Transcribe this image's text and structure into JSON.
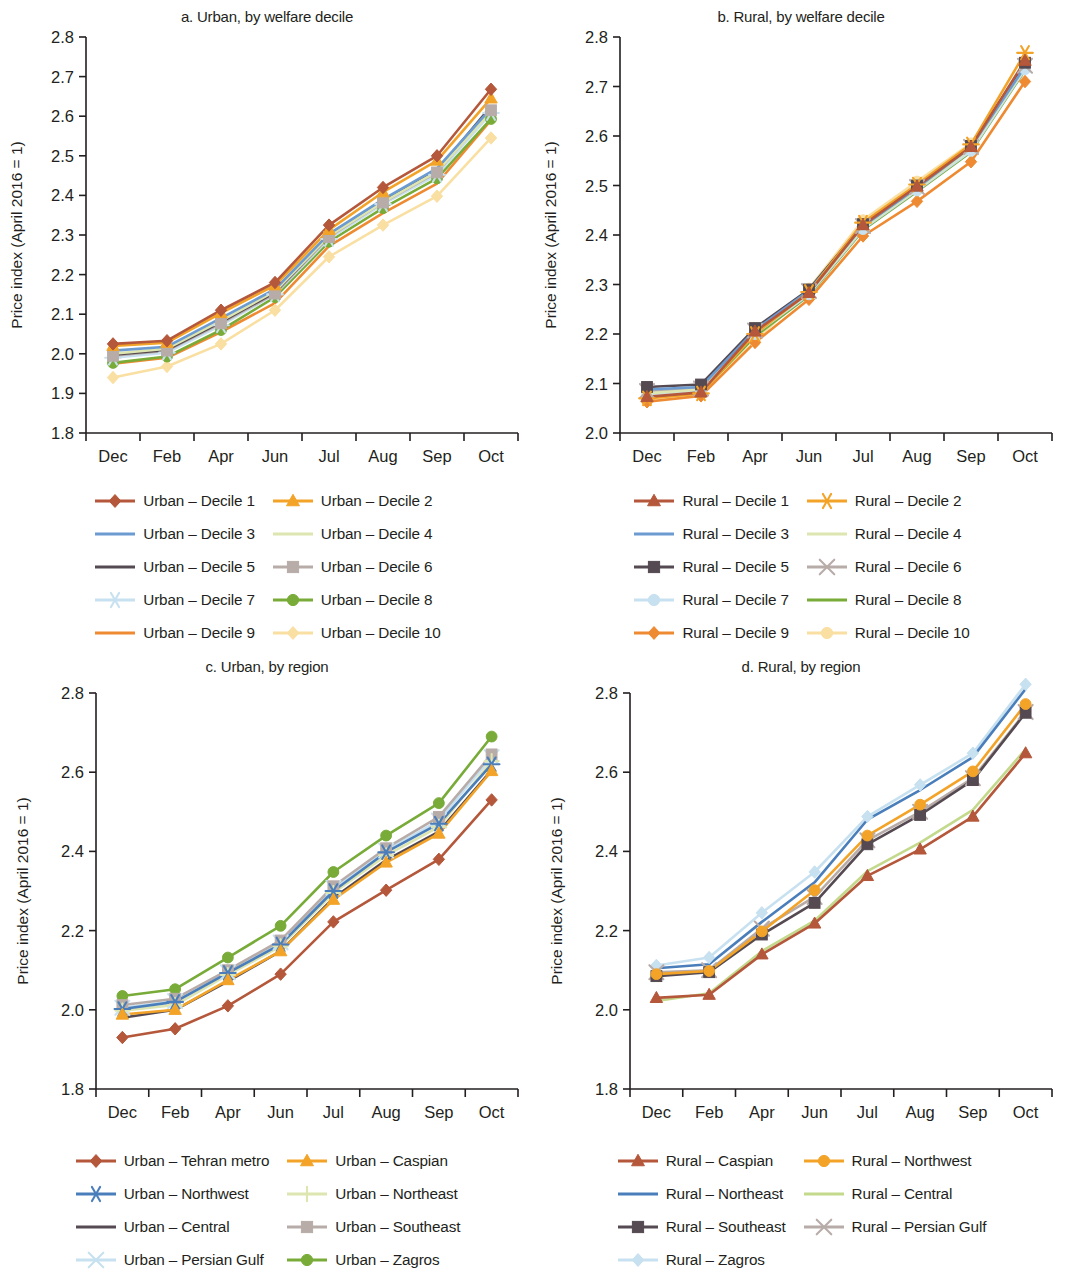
{
  "figure": {
    "panels": [
      {
        "id": "a",
        "title": "a. Urban, by welfare decile",
        "ylabel": "Price index (April 2016 = 1)",
        "legend_columns": 2
      },
      {
        "id": "b",
        "title": "b. Rural, by welfare decile",
        "ylabel": "Price index (April 2016 = 1)",
        "legend_columns": 2
      },
      {
        "id": "c",
        "title": "c. Urban, by region",
        "ylabel": "Price index (April 2016 = 1)",
        "legend_columns": 2
      },
      {
        "id": "d",
        "title": "d. Rural, by region",
        "ylabel": "Price index (April 2016 = 1)",
        "legend_columns": 2
      }
    ]
  },
  "chart_data": [
    {
      "id": "a",
      "type": "line",
      "title": "a. Urban, by welfare decile",
      "xlabel": "",
      "ylabel": "Price index (April 2016 = 1)",
      "categories": [
        "Dec",
        "Feb",
        "Apr",
        "Jun",
        "Jul",
        "Aug",
        "Sep",
        "Oct"
      ],
      "ylim": [
        1.8,
        2.8
      ],
      "yticks": [
        "1.8",
        "1.9",
        "2.0",
        "2.1",
        "2.2",
        "2.3",
        "2.4",
        "2.5",
        "2.6",
        "2.7",
        "2.8"
      ],
      "grid": false,
      "legend_position": "bottom",
      "series": [
        {
          "name": "Urban – Decile 1",
          "color": "#b4573a",
          "marker": "diamond",
          "values": [
            2.025,
            2.033,
            2.11,
            2.18,
            2.325,
            2.42,
            2.5,
            2.668
          ]
        },
        {
          "name": "Urban – Decile 2",
          "color": "#f2a328",
          "marker": "triangle",
          "values": [
            2.02,
            2.028,
            2.103,
            2.173,
            2.313,
            2.408,
            2.488,
            2.645
          ]
        },
        {
          "name": "Urban – Decile 3",
          "color": "#6c9bd2",
          "marker": "none",
          "values": [
            2.008,
            2.018,
            2.09,
            2.163,
            2.303,
            2.39,
            2.468,
            2.62
          ]
        },
        {
          "name": "Urban – Decile 4",
          "color": "#dde6b0",
          "marker": "none",
          "values": [
            2.0,
            2.013,
            2.083,
            2.158,
            2.297,
            2.383,
            2.46,
            2.612
          ]
        },
        {
          "name": "Urban – Decile 5",
          "color": "#554a51",
          "marker": "none",
          "values": [
            1.998,
            2.01,
            2.08,
            2.155,
            2.298,
            2.385,
            2.462,
            2.625
          ]
        },
        {
          "name": "Urban – Decile 6",
          "color": "#b8aca9",
          "marker": "square",
          "values": [
            1.995,
            2.008,
            2.077,
            2.152,
            2.295,
            2.382,
            2.458,
            2.615
          ]
        },
        {
          "name": "Urban – Decile 7",
          "color": "#c7e1f0",
          "marker": "star",
          "values": [
            1.99,
            2.003,
            2.072,
            2.15,
            2.29,
            2.378,
            2.452,
            2.608
          ]
        },
        {
          "name": "Urban – Decile 8",
          "color": "#78ab38",
          "marker": "circle",
          "values": [
            1.977,
            1.993,
            2.06,
            2.143,
            2.283,
            2.368,
            2.443,
            2.593
          ]
        },
        {
          "name": "Urban – Decile 9",
          "color": "#ee8a32",
          "marker": "none",
          "values": [
            1.975,
            1.99,
            2.055,
            2.128,
            2.272,
            2.355,
            2.43,
            2.59
          ]
        },
        {
          "name": "Urban – Decile 10",
          "color": "#fadfa2",
          "marker": "diamond",
          "values": [
            1.94,
            1.968,
            2.025,
            2.11,
            2.245,
            2.325,
            2.398,
            2.545
          ]
        }
      ]
    },
    {
      "id": "b",
      "type": "line",
      "title": "b. Rural, by welfare decile",
      "xlabel": "",
      "ylabel": "Price index (April 2016 = 1)",
      "categories": [
        "Dec",
        "Feb",
        "Apr",
        "Jun",
        "Jul",
        "Aug",
        "Sep",
        "Oct"
      ],
      "ylim": [
        2.0,
        2.8
      ],
      "yticks": [
        "2.0",
        "2.1",
        "2.2",
        "2.3",
        "2.4",
        "2.5",
        "2.6",
        "2.7",
        "2.8"
      ],
      "grid": false,
      "legend_position": "bottom",
      "series": [
        {
          "name": "Rural – Decile 1",
          "color": "#b4573a",
          "marker": "triangle",
          "values": [
            2.073,
            2.082,
            2.205,
            2.283,
            2.42,
            2.498,
            2.578,
            2.752
          ]
        },
        {
          "name": "Rural – Decile 2",
          "color": "#f2a328",
          "marker": "star",
          "values": [
            2.07,
            2.08,
            2.2,
            2.285,
            2.425,
            2.502,
            2.583,
            2.768
          ]
        },
        {
          "name": "Rural – Decile 3",
          "color": "#6c9bd2",
          "marker": "none",
          "values": [
            2.088,
            2.093,
            2.208,
            2.288,
            2.418,
            2.495,
            2.578,
            2.74
          ]
        },
        {
          "name": "Rural – Decile 4",
          "color": "#dde6b0",
          "marker": "none",
          "values": [
            2.08,
            2.088,
            2.203,
            2.283,
            2.415,
            2.492,
            2.575,
            2.738
          ]
        },
        {
          "name": "Rural – Decile 5",
          "color": "#554a51",
          "marker": "square",
          "values": [
            2.093,
            2.098,
            2.212,
            2.29,
            2.422,
            2.5,
            2.58,
            2.748
          ]
        },
        {
          "name": "Rural – Decile 6",
          "color": "#b8aca9",
          "marker": "x",
          "values": [
            2.085,
            2.09,
            2.207,
            2.287,
            2.418,
            2.497,
            2.578,
            2.742
          ]
        },
        {
          "name": "Rural – Decile 7",
          "color": "#c7e1f0",
          "marker": "circle",
          "values": [
            2.078,
            2.085,
            2.2,
            2.28,
            2.412,
            2.49,
            2.57,
            2.735
          ]
        },
        {
          "name": "Rural – Decile 8",
          "color": "#78ab38",
          "marker": "none",
          "values": [
            2.072,
            2.082,
            2.195,
            2.278,
            2.41,
            2.488,
            2.568,
            2.733
          ]
        },
        {
          "name": "Rural – Decile 9",
          "color": "#ee8a32",
          "marker": "diamond",
          "values": [
            2.063,
            2.075,
            2.183,
            2.27,
            2.398,
            2.468,
            2.548,
            2.71
          ]
        },
        {
          "name": "Rural – Decile 10",
          "color": "#fadfa2",
          "marker": "circle",
          "values": [
            2.065,
            2.078,
            2.185,
            2.292,
            2.43,
            2.508,
            2.585,
            2.742
          ]
        }
      ]
    },
    {
      "id": "c",
      "type": "line",
      "title": "c. Urban, by region",
      "xlabel": "",
      "ylabel": "Price index (April 2016 = 1)",
      "categories": [
        "Dec",
        "Feb",
        "Apr",
        "Jun",
        "Jul",
        "Aug",
        "Sep",
        "Oct"
      ],
      "ylim": [
        1.8,
        2.8
      ],
      "yticks": [
        "1.8",
        "2.0",
        "2.2",
        "2.4",
        "2.6",
        "2.8"
      ],
      "grid": false,
      "legend_position": "bottom",
      "series": [
        {
          "name": "Urban – Tehran metro",
          "color": "#b4573a",
          "marker": "diamond",
          "values": [
            1.93,
            1.952,
            2.01,
            2.09,
            2.222,
            2.302,
            2.38,
            2.53
          ]
        },
        {
          "name": "Urban – Caspian",
          "color": "#f2a328",
          "marker": "triangle",
          "values": [
            1.988,
            2.0,
            2.075,
            2.148,
            2.278,
            2.372,
            2.445,
            2.603
          ]
        },
        {
          "name": "Urban – Northwest",
          "color": "#4a7ebb",
          "marker": "star",
          "values": [
            2.002,
            2.02,
            2.093,
            2.165,
            2.3,
            2.398,
            2.47,
            2.62
          ]
        },
        {
          "name": "Urban – Northeast",
          "color": "#dde6b0",
          "marker": "plus",
          "values": [
            1.998,
            2.012,
            2.088,
            2.16,
            2.295,
            2.39,
            2.462,
            2.628
          ]
        },
        {
          "name": "Urban – Central",
          "color": "#554a51",
          "marker": "none",
          "values": [
            1.98,
            2.0,
            2.072,
            2.148,
            2.282,
            2.378,
            2.45,
            2.605
          ]
        },
        {
          "name": "Urban – Southeast",
          "color": "#b8aca9",
          "marker": "square",
          "values": [
            2.012,
            2.028,
            2.1,
            2.175,
            2.312,
            2.408,
            2.487,
            2.645
          ]
        },
        {
          "name": "Urban – Persian Gulf",
          "color": "#c7e1f0",
          "marker": "x",
          "values": [
            2.005,
            2.022,
            2.095,
            2.17,
            2.308,
            2.402,
            2.478,
            2.638
          ]
        },
        {
          "name": "Urban – Zagros",
          "color": "#78ab38",
          "marker": "circle",
          "values": [
            2.035,
            2.052,
            2.132,
            2.212,
            2.348,
            2.44,
            2.522,
            2.69
          ]
        }
      ]
    },
    {
      "id": "d",
      "type": "line",
      "title": "d. Rural, by region",
      "xlabel": "",
      "ylabel": "Price index (April 2016 = 1)",
      "categories": [
        "Dec",
        "Feb",
        "Apr",
        "Jun",
        "Jul",
        "Aug",
        "Sep",
        "Oct"
      ],
      "ylim": [
        1.8,
        2.8
      ],
      "yticks": [
        "1.8",
        "2.0",
        "2.2",
        "2.4",
        "2.6",
        "2.8"
      ],
      "grid": false,
      "legend_position": "bottom",
      "series": [
        {
          "name": "Rural – Caspian",
          "color": "#b4573a",
          "marker": "triangle",
          "values": [
            2.03,
            2.038,
            2.14,
            2.218,
            2.338,
            2.405,
            2.488,
            2.648
          ]
        },
        {
          "name": "Rural – Northwest",
          "color": "#f2a328",
          "marker": "circle",
          "values": [
            2.09,
            2.098,
            2.198,
            2.302,
            2.44,
            2.518,
            2.602,
            2.772
          ]
        },
        {
          "name": "Rural – Northeast",
          "color": "#4a7ebb",
          "marker": "none",
          "values": [
            2.105,
            2.115,
            2.222,
            2.322,
            2.48,
            2.555,
            2.638,
            2.81
          ]
        },
        {
          "name": "Rural – Central",
          "color": "#c3d98b",
          "marker": "none",
          "values": [
            2.022,
            2.042,
            2.148,
            2.225,
            2.35,
            2.422,
            2.505,
            2.658
          ]
        },
        {
          "name": "Rural – Southeast",
          "color": "#554a51",
          "marker": "square",
          "values": [
            2.085,
            2.095,
            2.19,
            2.27,
            2.418,
            2.492,
            2.58,
            2.75
          ]
        },
        {
          "name": "Rural – Persian Gulf",
          "color": "#b8aca9",
          "marker": "x",
          "values": [
            2.095,
            2.1,
            2.205,
            2.285,
            2.428,
            2.5,
            2.585,
            2.752
          ]
        },
        {
          "name": "Rural – Zagros",
          "color": "#c7e1f0",
          "marker": "diamond",
          "values": [
            2.112,
            2.132,
            2.245,
            2.348,
            2.488,
            2.568,
            2.648,
            2.822
          ]
        }
      ]
    }
  ]
}
